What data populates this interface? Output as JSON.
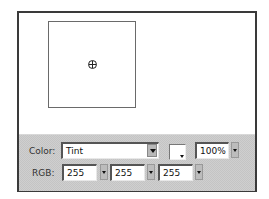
{
  "canvas": {
    "preview_background": "#ffffff",
    "crosshair_icon": "registration-point-icon"
  },
  "panel": {
    "color_label": "Color:",
    "color_mode": "Tint",
    "tint_swatch_color": "#ffffff",
    "tint_percent": "100%",
    "rgb_label": "RGB:",
    "rgb": {
      "r": "255",
      "g": "255",
      "b": "255"
    }
  }
}
